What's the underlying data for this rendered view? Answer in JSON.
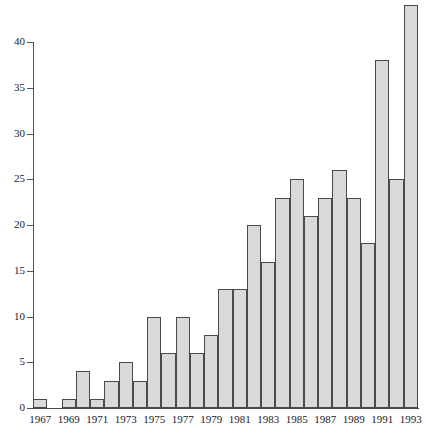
{
  "chart_data": {
    "type": "bar",
    "title": "",
    "subtitle": "",
    "xlabel": "",
    "ylabel": "",
    "categories": [
      "1967",
      "1968",
      "1969",
      "1970",
      "1971",
      "1972",
      "1973",
      "1974",
      "1975",
      "1976",
      "1977",
      "1978",
      "1979",
      "1980",
      "1981",
      "1982",
      "1983",
      "1984",
      "1985",
      "1986",
      "1987",
      "1988",
      "1989",
      "1990",
      "1991",
      "1992",
      "1993"
    ],
    "values": [
      1,
      0,
      1,
      4,
      1,
      3,
      5,
      3,
      10,
      6,
      10,
      6,
      8,
      13,
      13,
      20,
      16,
      23,
      25,
      21,
      23,
      26,
      23,
      18,
      38,
      25,
      44
    ],
    "ytick_labels": [
      "0",
      "5",
      "10",
      "15",
      "20",
      "25",
      "30",
      "35",
      "40"
    ],
    "yticks": [
      0,
      5,
      10,
      15,
      20,
      25,
      30,
      35,
      40
    ],
    "ylim": [
      0,
      44
    ],
    "xtick_labels": [
      "1967",
      "1969",
      "1971",
      "1973",
      "1975",
      "1977",
      "1979",
      "1981",
      "1983",
      "1985",
      "1987",
      "1989",
      "1993",
      "1991"
    ],
    "visible_xtick_years": [
      "1967",
      "1969",
      "1971",
      "1973",
      "1975",
      "1977",
      "1979",
      "1981",
      "1983",
      "1985",
      "1987",
      "1989",
      "1991",
      "1993"
    ],
    "grid": false,
    "legend": false,
    "legend_position": "none",
    "bar_fill_color": "#d9d9d9",
    "bar_edge_color": "#4a4a4a",
    "axis_color": "#4a4a4a",
    "text_color": "#1a1a2e",
    "background_color": "#ffffff"
  }
}
